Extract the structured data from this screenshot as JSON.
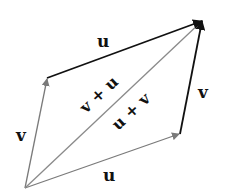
{
  "diagram": {
    "vectors": [
      {
        "id": "v_left",
        "label": "v",
        "from": [
          25,
          188
        ],
        "to": [
          47,
          78
        ],
        "color": "#7a7a7a"
      },
      {
        "id": "u_top",
        "label": "u",
        "from": [
          47,
          78
        ],
        "to": [
          203,
          20
        ],
        "color": "#111111"
      },
      {
        "id": "u_bottom",
        "label": "u",
        "from": [
          25,
          188
        ],
        "to": [
          180,
          134
        ],
        "color": "#7a7a7a"
      },
      {
        "id": "v_right",
        "label": "v",
        "from": [
          180,
          134
        ],
        "to": [
          203,
          20
        ],
        "color": "#111111"
      },
      {
        "id": "sum",
        "label": "",
        "from": [
          25,
          188
        ],
        "to": [
          203,
          20
        ],
        "color": "#8a8a8a"
      }
    ],
    "labels": {
      "u_top": "u",
      "v_left": "v",
      "u_bottom": "u",
      "v_right": "v",
      "sum_upper": "v + u",
      "sum_lower": "u + v"
    }
  }
}
